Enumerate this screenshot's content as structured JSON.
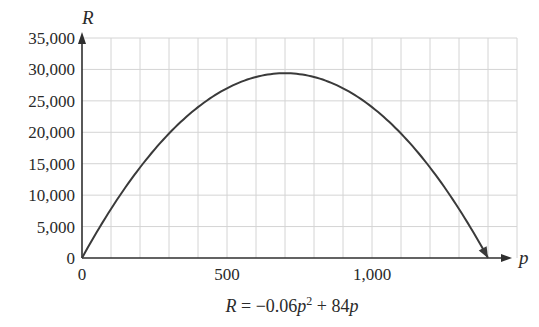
{
  "chart_data": {
    "type": "line",
    "title": "",
    "xlabel": "p",
    "ylabel": "R",
    "equation": "R = −0.06p² + 84p",
    "equation_parts": {
      "lhs": "R",
      "eq": " = −0.06",
      "var1": "p",
      "exp": "2",
      "mid": " + 84",
      "var2": "p"
    },
    "xlim": [
      0,
      1500
    ],
    "ylim": [
      0,
      35000
    ],
    "x_grid_step": 100,
    "y_grid_step": 5000,
    "grid": true,
    "x_ticks": [
      {
        "value": 0,
        "label": "0"
      },
      {
        "value": 500,
        "label": "500"
      },
      {
        "value": 1000,
        "label": "1,000"
      }
    ],
    "y_ticks": [
      {
        "value": 0,
        "label": "0"
      },
      {
        "value": 5000,
        "label": "5,000"
      },
      {
        "value": 10000,
        "label": "10,000"
      },
      {
        "value": 15000,
        "label": "15,000"
      },
      {
        "value": 20000,
        "label": "20,000"
      },
      {
        "value": 25000,
        "label": "25,000"
      },
      {
        "value": 30000,
        "label": "30,000"
      },
      {
        "value": 35000,
        "label": "35,000"
      }
    ],
    "series": [
      {
        "name": "R = -0.06p^2 + 84p",
        "function": {
          "a": -0.06,
          "b": 84,
          "c": 0
        },
        "x_range": [
          0,
          1400
        ],
        "x": [
          0,
          100,
          200,
          300,
          400,
          500,
          600,
          700,
          800,
          900,
          1000,
          1100,
          1200,
          1300,
          1400
        ],
        "values": [
          0,
          7800,
          14400,
          19800,
          24000,
          27000,
          28800,
          29400,
          28800,
          27000,
          24000,
          19800,
          14400,
          7800,
          0
        ],
        "end_arrow": true
      }
    ]
  }
}
